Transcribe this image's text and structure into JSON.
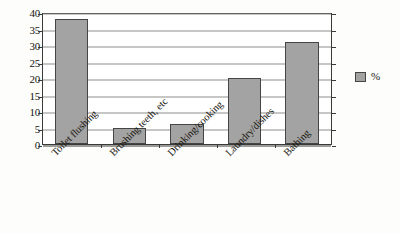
{
  "chart_data": {
    "type": "bar",
    "title": "",
    "subtitle": "",
    "xlabel": "",
    "ylabel": "",
    "categories": [
      "Toilet flushing",
      "Brushing teeth, etc",
      "Drinking/cooking",
      "Laundry/dishes",
      "Bathing"
    ],
    "values": [
      38,
      5,
      6,
      20,
      31
    ],
    "series": [
      {
        "name": "%",
        "values": [
          38,
          5,
          6,
          20,
          31
        ]
      }
    ],
    "ylim": [
      0,
      40
    ],
    "ytick_step": 5,
    "yticks": [
      "40",
      "35",
      "30",
      "25",
      "20",
      "15",
      "10",
      "5",
      "0"
    ],
    "ytick_values": [
      40,
      35,
      30,
      25,
      20,
      15,
      10,
      5,
      0
    ],
    "grid": true,
    "grid_axis": "y",
    "legend": {
      "position": "right",
      "entries": [
        {
          "label": "%",
          "color": "#a3a3a3"
        }
      ]
    },
    "xtick_rotation": -45,
    "colors": {
      "bar_fill": "#a3a3a3",
      "bar_border": "#454543",
      "gridline": "#8e8e8c",
      "axis": "#3a3a38",
      "plot_background": "#ffffff",
      "page_background": "#fdfdfb",
      "text": "#17160f"
    }
  }
}
